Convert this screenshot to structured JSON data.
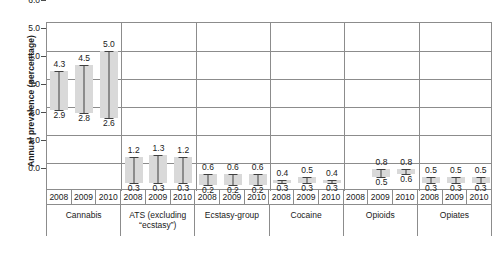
{
  "chart_data": {
    "type": "bar",
    "title": "",
    "xlabel": "",
    "ylabel": "Annual prevalence (percentage)",
    "ylim": [
      0.0,
      6.0
    ],
    "yticks": [
      "0.0",
      "1.0",
      "2.0",
      "3.0",
      "4.0",
      "5.0",
      "6.0"
    ],
    "ytick_values": [
      0.0,
      1.0,
      2.0,
      3.0,
      4.0,
      5.0,
      6.0
    ],
    "grid": true,
    "legend": "none",
    "years": [
      "2008",
      "2009",
      "2010"
    ],
    "groups": [
      {
        "label": "Cannabis",
        "label_lines": [
          "Cannabis"
        ],
        "points": [
          {
            "year": "2008",
            "low": 2.9,
            "high": 4.3,
            "low_label": "2.9",
            "high_label": "4.3",
            "has_data": true
          },
          {
            "year": "2009",
            "low": 2.8,
            "high": 4.5,
            "low_label": "2.8",
            "high_label": "4.5",
            "has_data": true
          },
          {
            "year": "2010",
            "low": 2.6,
            "high": 5.0,
            "low_label": "2.6",
            "high_label": "5.0",
            "has_data": true
          }
        ]
      },
      {
        "label": "ATS (excluding \"ecstasy\")",
        "label_lines": [
          "ATS (excluding",
          "“ecstasy”)"
        ],
        "points": [
          {
            "year": "2008",
            "low": 0.3,
            "high": 1.2,
            "low_label": "0.3",
            "high_label": "1.2",
            "has_data": true
          },
          {
            "year": "2009",
            "low": 0.3,
            "high": 1.3,
            "low_label": "0.3",
            "high_label": "1.3",
            "has_data": true
          },
          {
            "year": "2010",
            "low": 0.3,
            "high": 1.2,
            "low_label": "0.3",
            "high_label": "1.2",
            "has_data": true
          }
        ]
      },
      {
        "label": "Ecstasy-group",
        "label_lines": [
          "Ecstasy-group"
        ],
        "points": [
          {
            "year": "2008",
            "low": 0.2,
            "high": 0.6,
            "low_label": "0.2",
            "high_label": "0.6",
            "has_data": true
          },
          {
            "year": "2009",
            "low": 0.2,
            "high": 0.6,
            "low_label": "0.2",
            "high_label": "0.6",
            "has_data": true
          },
          {
            "year": "2010",
            "low": 0.2,
            "high": 0.6,
            "low_label": "0.2",
            "high_label": "0.6",
            "has_data": true
          }
        ]
      },
      {
        "label": "Cocaine",
        "label_lines": [
          "Cocaine"
        ],
        "points": [
          {
            "year": "2008",
            "low": 0.3,
            "high": 0.4,
            "low_label": "0.3",
            "high_label": "0.4",
            "has_data": true
          },
          {
            "year": "2009",
            "low": 0.3,
            "high": 0.5,
            "low_label": "0.3",
            "high_label": "0.5",
            "has_data": true
          },
          {
            "year": "2010",
            "low": 0.3,
            "high": 0.4,
            "low_label": "0.3",
            "high_label": "0.4",
            "has_data": true
          }
        ]
      },
      {
        "label": "Opioids",
        "label_lines": [
          "Opioids"
        ],
        "points": [
          {
            "year": "2008",
            "low": null,
            "high": null,
            "low_label": "",
            "high_label": "",
            "has_data": false
          },
          {
            "year": "2009",
            "low": 0.5,
            "high": 0.8,
            "low_label": "0.5",
            "high_label": "0.8",
            "has_data": true
          },
          {
            "year": "2010",
            "low": 0.6,
            "high": 0.8,
            "low_label": "0.6",
            "high_label": "0.8",
            "has_data": true
          }
        ]
      },
      {
        "label": "Opiates",
        "label_lines": [
          "Opiates"
        ],
        "points": [
          {
            "year": "2008",
            "low": 0.3,
            "high": 0.5,
            "low_label": "0.3",
            "high_label": "0.5",
            "has_data": true
          },
          {
            "year": "2009",
            "low": 0.3,
            "high": 0.5,
            "low_label": "0.3",
            "high_label": "0.5",
            "has_data": true
          },
          {
            "year": "2010",
            "low": 0.3,
            "high": 0.5,
            "low_label": "0.3",
            "high_label": "0.5",
            "has_data": true
          }
        ]
      }
    ]
  },
  "colors": {
    "bar_fill": "#d9d9d9",
    "error_bar": "#404040",
    "grid": "#8c8c8c",
    "text": "#1a1a1a",
    "background": "#ffffff"
  }
}
